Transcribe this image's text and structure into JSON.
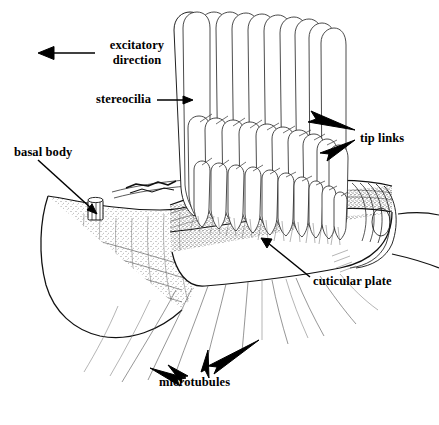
{
  "figure": {
    "background_color": "#ffffff",
    "ink_color": "#111111",
    "style": "black-and-white stippled line drawing"
  },
  "labels": {
    "excitatory_direction": {
      "line1": "excitatory",
      "line2": "direction",
      "arrow": "left-pointing-arrow",
      "x": 95,
      "y": 38
    },
    "stereocilia": {
      "text": "stereocilia",
      "pointer": "horizontal line to tall stereocilium",
      "x": 96,
      "y": 92
    },
    "tip_links": {
      "text": "tip links",
      "pointer": "two converging arrows",
      "x": 360,
      "y": 131
    },
    "basal_body": {
      "text": "basal body",
      "pointer": "diagonal line to small barrel structure",
      "x": 14,
      "y": 145
    },
    "cuticular_plate": {
      "text": "cuticular plate",
      "pointer": "diagonal arrow up-left",
      "x": 313,
      "y": 274
    },
    "microtubules": {
      "text": "microtubules",
      "pointer": "four arrows to fanning filaments",
      "x": 159,
      "y": 375
    }
  },
  "structures": {
    "tall_row_count": 15,
    "shorter_rows": 5,
    "bundle_shape": "staircase descending to the right",
    "apical_surface": "wavy stippled cuticular plate band",
    "cell_lobe": "left rounded lobe with crosshatch cytoskeleton mesh"
  }
}
